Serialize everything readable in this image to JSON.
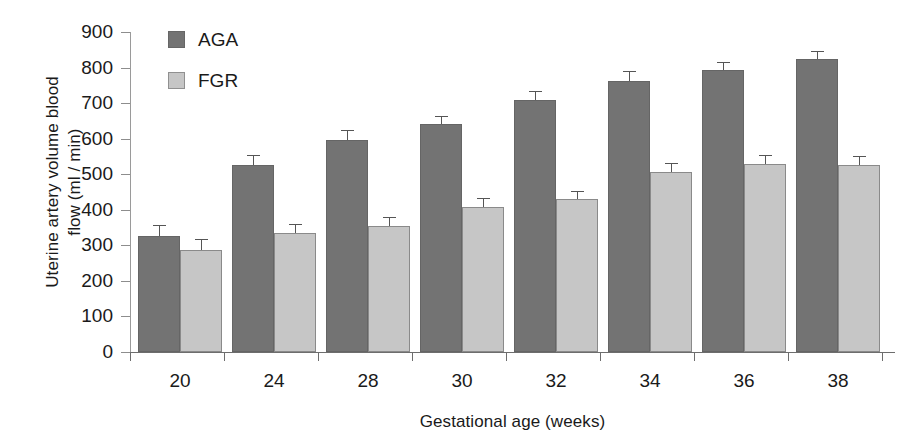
{
  "chart_data": {
    "type": "bar",
    "title": "",
    "xlabel": "Gestational age (weeks)",
    "ylabel": "Uterine artery volume blood\nflow (ml / min)",
    "ylabel_line1": "Uterine artery volume blood",
    "ylabel_line2": "flow (ml / min)",
    "categories": [
      "20",
      "24",
      "28",
      "30",
      "32",
      "34",
      "36",
      "38"
    ],
    "ylim": [
      0,
      900
    ],
    "yticks": [
      0,
      100,
      200,
      300,
      400,
      500,
      600,
      700,
      800,
      900
    ],
    "ytick_labels": [
      "0",
      "100",
      "200",
      "300",
      "400",
      "500",
      "600",
      "700",
      "800",
      "900"
    ],
    "grid": false,
    "legend_position": "upper-left-inside",
    "series": [
      {
        "name": "AGA",
        "color": "#737373",
        "values": [
          326,
          525,
          597,
          641,
          710,
          763,
          794,
          824
        ],
        "errors": [
          18,
          14,
          12,
          10,
          10,
          12,
          9,
          9
        ]
      },
      {
        "name": "FGR",
        "color": "#c6c6c6",
        "values": [
          288,
          334,
          355,
          408,
          430,
          505,
          530,
          526
        ],
        "errors": [
          16,
          13,
          11,
          11,
          9,
          13,
          11,
          12
        ]
      }
    ]
  },
  "legend": {
    "items": [
      {
        "label": "AGA",
        "swatch": "aga"
      },
      {
        "label": "FGR",
        "swatch": "fgr"
      }
    ]
  }
}
